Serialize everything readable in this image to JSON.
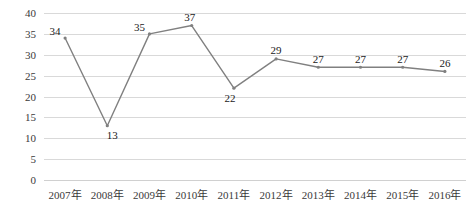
{
  "chart_data": {
    "type": "line",
    "title": "",
    "subtitle": "",
    "xlabel": "",
    "ylabel": "",
    "categories": [
      "2007年",
      "2008年",
      "2009年",
      "2010年",
      "2011年",
      "2012年",
      "2013年",
      "2014年",
      "2015年",
      "2016年"
    ],
    "values": [
      34,
      13,
      35,
      37,
      22,
      29,
      27,
      27,
      27,
      26
    ],
    "series": [
      {
        "name": "",
        "values": [
          34,
          13,
          35,
          37,
          22,
          29,
          27,
          27,
          27,
          26
        ]
      }
    ],
    "ylim": [
      0,
      40
    ],
    "yticks": [
      0,
      5,
      10,
      15,
      20,
      25,
      30,
      35,
      40
    ],
    "ytick_labels": [
      "0",
      "5",
      "10",
      "15",
      "20",
      "25",
      "30",
      "35",
      "40"
    ],
    "grid": true,
    "grid_axis": "y",
    "legend": false,
    "legend_position": "none",
    "data_labels": true,
    "colors": {
      "line": "#808080",
      "marker": "#808080",
      "gridline": "#d9d9d9",
      "axis": "#d0d0d0",
      "tick_text": "#3a3a3a",
      "data_label_text": "#1a1a1a",
      "background": "#ffffff"
    }
  }
}
